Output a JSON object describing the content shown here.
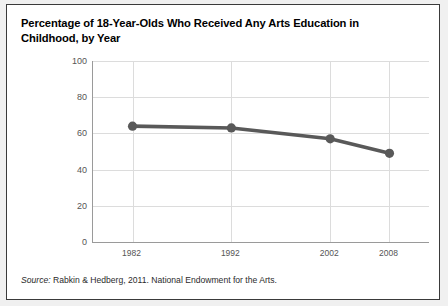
{
  "figure": {
    "title": "Percentage of 18-Year-Olds Who Received Any Arts Education in Childhood, by Year",
    "source_label": "Source:",
    "source_text": " Rabkin & Hedberg, 2011. National Endowment for the Arts.",
    "colors": {
      "series": "#595959",
      "gridline": "#dcdcdc",
      "axis": "#9a9a9a",
      "card_background": "#ffffff",
      "page_background": "#f0f0f0",
      "border": "#3a3a3a",
      "tick_text": "#555555",
      "title_text": "#000000"
    }
  },
  "chart_data": {
    "type": "line",
    "title": "Percentage of 18-Year-Olds Who Received Any Arts Education in Childhood, by Year",
    "xlabel": "",
    "ylabel": "",
    "x": [
      1982,
      1992,
      2002,
      2008
    ],
    "categories": [
      "1982",
      "1992",
      "2002",
      "2008"
    ],
    "values": [
      64,
      63,
      57,
      49
    ],
    "series": [
      {
        "name": "Percentage receiving any arts education in childhood",
        "values": [
          64,
          63,
          57,
          49
        ]
      }
    ],
    "ylim": [
      0,
      100
    ],
    "yticks": [
      0,
      20,
      40,
      60,
      80,
      100
    ],
    "ytick_labels": [
      "0",
      "20",
      "40",
      "60",
      "80",
      "100"
    ],
    "xlim": [
      1978,
      2012
    ],
    "xticks": [
      1982,
      1992,
      2002,
      2008
    ],
    "xtick_labels": [
      "1982",
      "1992",
      "2002",
      "2008"
    ],
    "grid": true,
    "legend": "none",
    "marker": "circle",
    "line_color": "#595959"
  }
}
